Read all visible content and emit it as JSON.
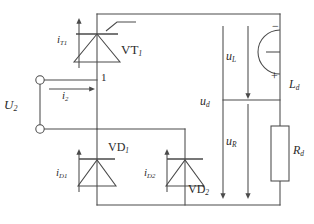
{
  "diagram": {
    "line_color": "#4a4a4a",
    "text_color": "#2b2b2b",
    "background": "#ffffff"
  },
  "labels": {
    "source_voltage": "U",
    "source_voltage_sub": "2",
    "source_current": "i",
    "source_current_sub": "2",
    "terminal_one": "1",
    "thyristor_name": "VT",
    "thyristor_name_sub": "1",
    "thyristor_current": "i",
    "thyristor_current_sub": "T1",
    "diode1_name": "VD",
    "diode1_name_sub": "1",
    "diode1_current": "i",
    "diode1_current_sub": "D1",
    "diode2_name": "VD",
    "diode2_name_sub": "2",
    "diode2_current": "i",
    "diode2_current_sub": "D2",
    "output_voltage": "u",
    "output_voltage_sub": "d",
    "inductor_voltage": "u",
    "inductor_voltage_sub": "L",
    "resistor_voltage": "u",
    "resistor_voltage_sub": "R",
    "inductor_name": "L",
    "inductor_name_sub": "d",
    "resistor_name": "R",
    "resistor_name_sub": "d",
    "inductor_polarity_negative": "−",
    "inductor_polarity_positive": "+"
  }
}
